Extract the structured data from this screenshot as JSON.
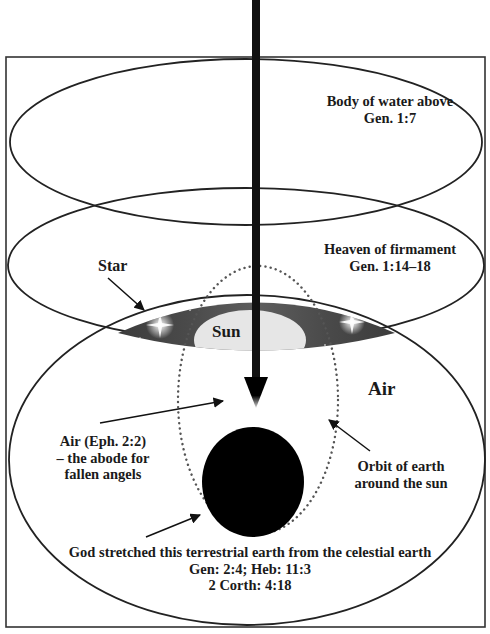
{
  "diagram": {
    "colors": {
      "outline": "#222222",
      "frame": "#333333",
      "sky_band_dark": "#3a3a3a",
      "sky_band_mid": "#5a5a5a",
      "sun_dome": "#e6e6e6",
      "earth": "#000000",
      "orbit_dots": "#555555",
      "background": "#ffffff"
    },
    "regions": [
      {
        "id": "waters-above",
        "label": "Body of water above",
        "ref": "Gen. 1:7"
      },
      {
        "id": "firmament",
        "label": "Heaven of firmament",
        "ref": "Gen. 1:14–18"
      },
      {
        "id": "air",
        "label": "Air"
      }
    ],
    "labels": {
      "water_line1": "Body of water above",
      "water_line2": "Gen. 1:7",
      "heaven_line1": "Heaven of firmament",
      "heaven_line2": "Gen. 1:14–18",
      "star": "Star",
      "sun": "Sun",
      "air": "Air",
      "fallen_line1": "Air (Eph. 2:2)",
      "fallen_line2": "– the abode for",
      "fallen_line3": "fallen angels",
      "orbit_line1": "Orbit of earth",
      "orbit_line2": "around the sun",
      "god_line1": "God stretched this terrestrial earth from the celestial earth",
      "god_line2": "Gen: 2:4; Heb: 11:3",
      "god_line3": "2 Corth: 4:18"
    },
    "icons": {
      "stars": "star-sparkle-icon",
      "sun": "sun-dome-icon",
      "earth": "earth-circle-icon",
      "arrow": "down-arrow-icon"
    }
  }
}
